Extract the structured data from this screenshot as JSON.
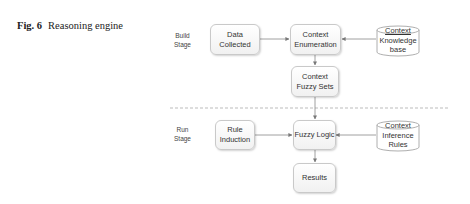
{
  "caption": {
    "label": "Fig. 6",
    "title": "Reasoning engine"
  },
  "stages": {
    "build": {
      "line1": "Build",
      "line2": "Stage"
    },
    "run": {
      "line1": "Run",
      "line2": "Stage"
    }
  },
  "nodes": {
    "data_collected": {
      "line1": "Data",
      "line2": "Collected"
    },
    "context_enumeration": {
      "line1": "Context",
      "line2": "Enumeration"
    },
    "context_fuzzy_sets": {
      "line1": "Context",
      "line2": "Fuzzy Sets"
    },
    "knowledge_base": {
      "line1": "Context",
      "line2": "Knowledge",
      "line3": "base"
    },
    "rule_induction": {
      "line1": "Rule",
      "line2": "Induction"
    },
    "fuzzy_logic": {
      "line1": "Fuzzy Logic"
    },
    "inference_rules": {
      "line1": "Context",
      "line2": "Inference",
      "line3": "Rules"
    },
    "results": {
      "line1": "Results"
    }
  },
  "edges": [
    {
      "from": "Data Collected",
      "to": "Context Enumeration"
    },
    {
      "from": "Context Knowledge base",
      "to": "Context Enumeration"
    },
    {
      "from": "Context Enumeration",
      "to": "Context Fuzzy Sets"
    },
    {
      "from": "Context Fuzzy Sets",
      "to": "Fuzzy Logic"
    },
    {
      "from": "Rule Induction",
      "to": "Fuzzy Logic"
    },
    {
      "from": "Context Inference Rules",
      "to": "Fuzzy Logic"
    },
    {
      "from": "Fuzzy Logic",
      "to": "Results"
    }
  ],
  "colors": {
    "line": "#888888",
    "box_border": "#c9c9c9",
    "divider": "#bbbbbb"
  }
}
